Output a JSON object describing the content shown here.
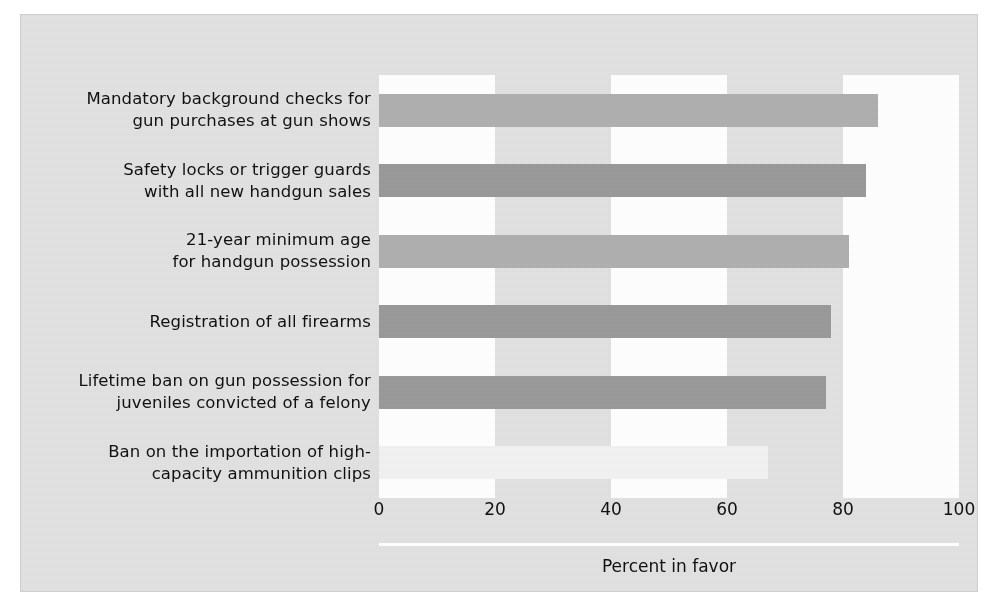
{
  "chart_data": {
    "type": "bar",
    "orientation": "horizontal",
    "title": "",
    "subtitle": "",
    "xlabel": "Percent in favor",
    "ylabel": "",
    "xlim": [
      0,
      100
    ],
    "xticks": [
      "0",
      "20",
      "40",
      "60",
      "80",
      "100"
    ],
    "xtick_values": [
      0,
      20,
      40,
      60,
      80,
      100
    ],
    "grid": false,
    "banding": "alternating vertical white and gray bands every 20 units",
    "legend": null,
    "categories": [
      "Mandatory background checks for gun purchases at gun shows",
      "Safety locks or trigger guards with all new handgun sales",
      "21-year minimum age for handgun possession",
      "Registration of all firearms",
      "Lifetime ban on gun possession for juveniles convicted of a felony",
      "Ban on the importation of high-capacity ammunition clips"
    ],
    "category_lines": [
      [
        "Mandatory background checks for",
        "gun purchases at gun shows"
      ],
      [
        "Safety locks or trigger guards",
        "with all new handgun sales"
      ],
      [
        "21-year minimum age",
        "for handgun possession"
      ],
      [
        "Registration of all firearms"
      ],
      [
        "Lifetime ban on gun possession for",
        "juveniles convicted of a felony"
      ],
      [
        "Ban on the importation of high-",
        "capacity ammunition clips"
      ]
    ],
    "values": [
      86,
      84,
      81,
      78,
      77,
      67
    ],
    "bar_colors": [
      "#b0b0b0",
      "#9a9a9a",
      "#b0b0b0",
      "#9a9a9a",
      "#9a9a9a",
      "#f2f2f2"
    ]
  },
  "figure": {
    "background_color": "#e2e2e2",
    "plot_band_white": "#ffffff",
    "plot_band_gray": "#e2e2e2",
    "text_color": "#111111",
    "axis_line_color": "#ffffff"
  }
}
